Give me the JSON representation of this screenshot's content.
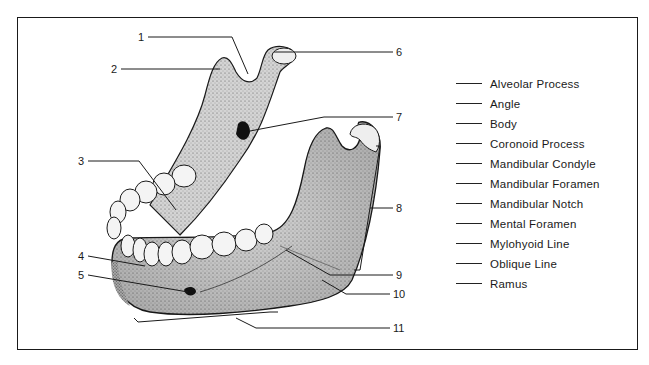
{
  "diagram": {
    "callouts": [
      {
        "number": "1",
        "x": 138,
        "y": 33
      },
      {
        "number": "2",
        "x": 111,
        "y": 65
      },
      {
        "number": "3",
        "x": 78,
        "y": 157
      },
      {
        "number": "4",
        "x": 78,
        "y": 252
      },
      {
        "number": "5",
        "x": 78,
        "y": 271
      },
      {
        "number": "6",
        "x": 396,
        "y": 50
      },
      {
        "number": "7",
        "x": 396,
        "y": 113
      },
      {
        "number": "8",
        "x": 396,
        "y": 205
      },
      {
        "number": "9",
        "x": 396,
        "y": 271
      },
      {
        "number": "10",
        "x": 393,
        "y": 290
      },
      {
        "number": "11",
        "x": 393,
        "y": 325
      }
    ]
  },
  "word_bank": {
    "terms": [
      "Alveolar Process",
      "Angle",
      "Body",
      "Coronoid Process",
      "Mandibular Condyle",
      "Mandibular Foramen",
      "Mandibular Notch",
      "Mental Foramen",
      "Mylohyoid Line",
      "Oblique Line",
      "Ramus"
    ]
  },
  "colors": {
    "ink": "#1a1a1a",
    "bone_fill": "#c9c9c9",
    "bone_dark": "#8a8a8a",
    "tooth_fill": "#f4f4f4"
  }
}
